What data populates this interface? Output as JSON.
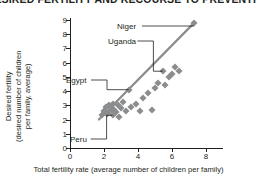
{
  "title": "DESIRED FERTILITY AND RECOURSE TO PREVENTIVE",
  "colors": {
    "text": "#231f20",
    "marker": "#8a8c8e",
    "trend_line": "#8a8c8e",
    "axis": "#231f20",
    "background": "#ffffff"
  },
  "chart_data": {
    "type": "scatter",
    "title": "DESIRED FERTILITY AND RECOURSE TO PREVENTIVE",
    "xlabel": "Total fertility rate (average number of children per family)",
    "ylabel": "Desired fertility (desired number of children per family, average)",
    "ylabel_line1": "Desired fertility",
    "ylabel_line2": "(desired number of children",
    "ylabel_line3": "per family, average)",
    "xlim": [
      0,
      9
    ],
    "ylim": [
      0,
      9.3
    ],
    "xticks": [
      0,
      2,
      4,
      6,
      8
    ],
    "yticks": [
      0,
      1,
      2,
      3,
      4,
      5,
      6,
      7,
      8,
      9
    ],
    "xtick_labels": [
      "0",
      "2",
      "4",
      "6",
      "8"
    ],
    "ytick_labels": [
      "0",
      "1",
      "2",
      "3",
      "4",
      "5",
      "6",
      "7",
      "8",
      "9"
    ],
    "grid": false,
    "legend": "none",
    "points": [
      {
        "x": 1.9,
        "y": 2.3
      },
      {
        "x": 2.0,
        "y": 2.6
      },
      {
        "x": 2.1,
        "y": 2.9
      },
      {
        "x": 2.2,
        "y": 2.4
      },
      {
        "x": 2.3,
        "y": 3.0
      },
      {
        "x": 2.35,
        "y": 2.6
      },
      {
        "x": 2.45,
        "y": 2.8
      },
      {
        "x": 2.5,
        "y": 2.3
      },
      {
        "x": 2.55,
        "y": 3.1
      },
      {
        "x": 2.6,
        "y": 2.7
      },
      {
        "x": 2.7,
        "y": 2.5
      },
      {
        "x": 2.8,
        "y": 3.0
      },
      {
        "x": 2.9,
        "y": 2.2
      },
      {
        "x": 3.0,
        "y": 2.8
      },
      {
        "x": 3.1,
        "y": 3.2
      },
      {
        "x": 3.3,
        "y": 2.6
      },
      {
        "x": 3.45,
        "y": 4.1
      },
      {
        "x": 3.6,
        "y": 2.9
      },
      {
        "x": 3.9,
        "y": 3.1
      },
      {
        "x": 4.1,
        "y": 2.6
      },
      {
        "x": 4.3,
        "y": 3.5
      },
      {
        "x": 4.6,
        "y": 3.9
      },
      {
        "x": 4.8,
        "y": 2.7
      },
      {
        "x": 5.0,
        "y": 4.2
      },
      {
        "x": 5.2,
        "y": 4.6
      },
      {
        "x": 5.45,
        "y": 5.4
      },
      {
        "x": 5.6,
        "y": 4.4
      },
      {
        "x": 5.8,
        "y": 5.0
      },
      {
        "x": 6.0,
        "y": 5.2
      },
      {
        "x": 6.2,
        "y": 5.7
      },
      {
        "x": 6.4,
        "y": 5.4
      },
      {
        "x": 7.3,
        "y": 8.8
      }
    ],
    "trend_line": {
      "x0": 1.7,
      "y0": 2.0,
      "x1": 7.3,
      "y1": 8.8
    },
    "annotations": [
      {
        "label": "Niger",
        "label_x": 117,
        "label_y": 22,
        "point_x": 7.3,
        "point_y": 8.8
      },
      {
        "label": "Uganda",
        "label_x": 108,
        "label_y": 37,
        "point_x": 5.45,
        "point_y": 5.4
      },
      {
        "label": "Egypt",
        "label_x": 66,
        "label_y": 76,
        "point_x": 3.45,
        "point_y": 4.1
      },
      {
        "label": "Peru",
        "label_x": 70,
        "label_y": 135,
        "point_x": 2.5,
        "point_y": 2.3
      }
    ]
  }
}
